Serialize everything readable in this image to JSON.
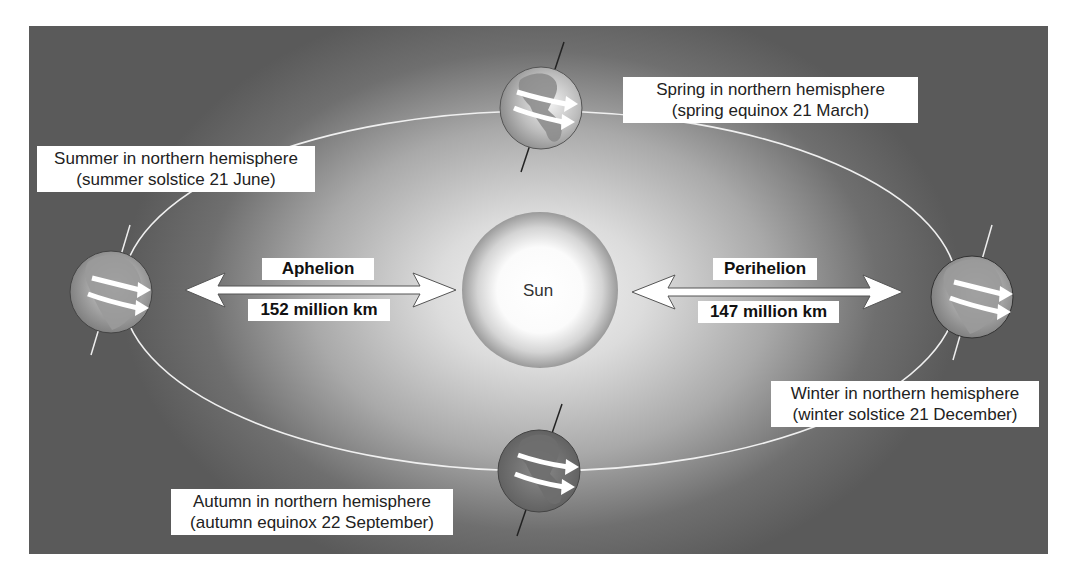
{
  "diagram": {
    "sun": {
      "label": "Sun"
    },
    "aphelion": {
      "label": "Aphelion",
      "distance": "152 million km"
    },
    "perihelion": {
      "label": "Perihelion",
      "distance": "147 million km"
    },
    "seasons": [
      {
        "id": "spring",
        "line1": "Spring in northern hemisphere",
        "line2": "(spring equinox 21 March)",
        "position": "top"
      },
      {
        "id": "summer",
        "line1": "Summer in northern hemisphere",
        "line2": "(summer solstice 21 June)",
        "position": "left"
      },
      {
        "id": "winter",
        "line1": "Winter in northern hemisphere",
        "line2": "(winter solstice 21 December)",
        "position": "right"
      },
      {
        "id": "autumn",
        "line1": "Autumn in northern hemisphere",
        "line2": "(autumn equinox 22 September)",
        "position": "bottom"
      }
    ],
    "colors": {
      "background_dark": "#5a5a5a",
      "background_light": "#f4f4f4",
      "orbit_line": "#f0f0f0",
      "label_bg": "#ffffff",
      "text": "#222222"
    },
    "icons": [
      "earth-globe-icon",
      "sun-icon",
      "double-arrow-icon",
      "axis-line-icon"
    ]
  }
}
